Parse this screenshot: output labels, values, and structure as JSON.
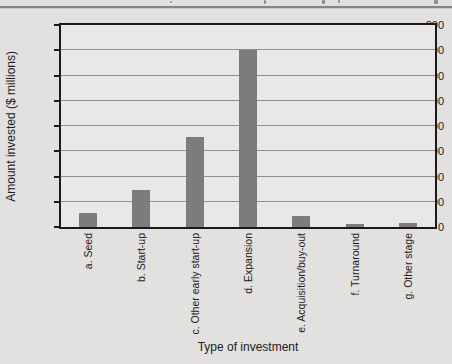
{
  "figure": {
    "page_background": "#e2e1df",
    "plot_background": "#e9e8e6",
    "frame_color": "#1b1b1b",
    "gridline_color": "#8f8f8f"
  },
  "chart_data": {
    "type": "bar",
    "title": "",
    "categories": [
      "a. Seed",
      "b. Start-up",
      "c. Other early start-up",
      "d. Expansion",
      "e. Acquisition/buy-out",
      "f. Turnaround",
      "g. Other stage"
    ],
    "values": [
      55,
      145,
      355,
      700,
      45,
      10,
      15
    ],
    "xlabel": "Type of investment",
    "ylabel": "Amount invested ($ millions)",
    "ylim": [
      0,
      800
    ],
    "yticks": [
      0,
      100,
      200,
      300,
      400,
      500,
      600,
      700,
      800
    ],
    "grid": true,
    "legend": false,
    "bar_color": "#7c7c7c"
  }
}
